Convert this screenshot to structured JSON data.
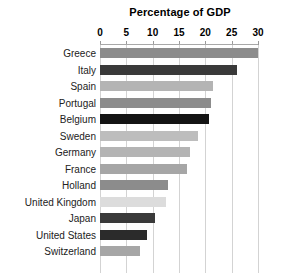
{
  "chart_data": {
    "type": "bar",
    "orientation": "horizontal",
    "title": "Percentage of GDP",
    "xlabel": "",
    "ylabel": "",
    "xlim": [
      0,
      30
    ],
    "xticks": [
      0,
      5,
      10,
      15,
      20,
      25,
      30
    ],
    "xtick_labels": [
      "0",
      "5",
      "10",
      "15",
      "20",
      "25",
      "30"
    ],
    "grid": true,
    "legend": false,
    "categories": [
      "Greece",
      "Italy",
      "Spain",
      "Portugal",
      "Belgium",
      "Sweden",
      "Germany",
      "France",
      "Holland",
      "United Kingdom",
      "Japan",
      "United States",
      "Switzerland"
    ],
    "values": [
      30,
      26,
      21.5,
      21,
      20.7,
      18.7,
      17,
      16.5,
      13,
      12.5,
      10.5,
      9,
      7.5
    ],
    "bar_colors": [
      "#8c8c8c",
      "#3a3a3a",
      "#b4b4b4",
      "#8c8c8c",
      "#141414",
      "#bdbdbd",
      "#b4b4b4",
      "#a6a6a6",
      "#8c8c8c",
      "#dcdcdc",
      "#3a3a3a",
      "#2b2b2b",
      "#a6a6a6"
    ]
  },
  "colors": {
    "background": "#ffffff",
    "gridline": "#d3d3d3",
    "axis_rule": "#a8a8a8",
    "text": "#222222",
    "title_text": "#000000"
  }
}
